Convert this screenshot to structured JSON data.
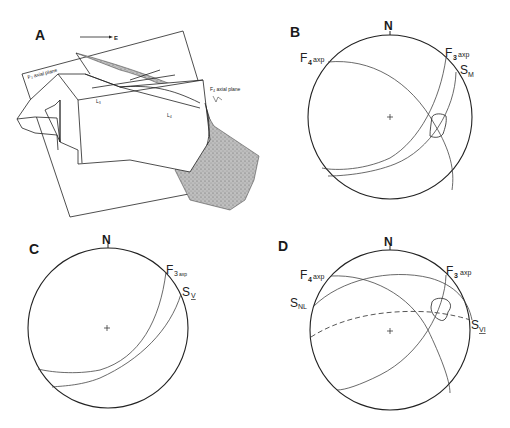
{
  "figure": {
    "panels": [
      {
        "id": "A",
        "label": "A",
        "type": "block-diagram",
        "direction_arrow": "E",
        "annotations": {
          "f3_plane": "F₃ axial plane",
          "f4_plane": "F₄ axial plane",
          "l3": "L₃",
          "l4": "L₄"
        }
      },
      {
        "id": "B",
        "label": "B",
        "type": "stereonet",
        "north": "N",
        "great_circles": [
          {
            "name": "F4",
            "main": "F",
            "sub": "4",
            "suffix": "axp"
          },
          {
            "name": "F3",
            "main": "F",
            "sub": "3",
            "suffix": "axp"
          },
          {
            "name": "SM",
            "main": "S",
            "sub": "M"
          }
        ],
        "contoured_region": "pole cluster"
      },
      {
        "id": "C",
        "label": "C",
        "type": "stereonet",
        "north": "N",
        "great_circles": [
          {
            "name": "F3",
            "main": "F",
            "sub": "3",
            "suffix": "axp"
          },
          {
            "name": "SV",
            "main": "S",
            "sub": "V"
          }
        ]
      },
      {
        "id": "D",
        "label": "D",
        "type": "stereonet",
        "north": "N",
        "great_circles": [
          {
            "name": "F4",
            "main": "F",
            "sub": "4",
            "suffix": "axp"
          },
          {
            "name": "F3",
            "main": "F",
            "sub": "3",
            "suffix": "axp"
          },
          {
            "name": "SNL",
            "main": "S",
            "sub": "NL"
          },
          {
            "name": "SVI",
            "main": "S",
            "sub": "VI",
            "style": "dashed"
          }
        ],
        "contoured_region": "pole cluster"
      }
    ]
  }
}
